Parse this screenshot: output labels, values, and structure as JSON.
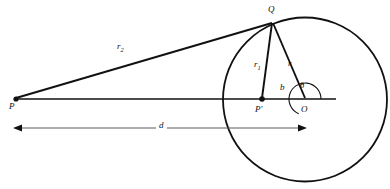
{
  "figure": {
    "type": "geometry-diagram",
    "background_color": "#ffffff",
    "stroke_color": "#111111",
    "dimension_color": "#5a5a5a"
  },
  "points": [
    {
      "id": "P",
      "label": "P",
      "x": 16,
      "y": 99,
      "label_x": 10,
      "label_y": 103,
      "dot": true,
      "dot_r": 2.6
    },
    {
      "id": "Q",
      "label": "Q",
      "x": 272,
      "y": 22,
      "label_x": 269,
      "label_y": 7,
      "dot": false,
      "dot_r": 0
    },
    {
      "id": "Pprime",
      "label": "P′",
      "x": 262,
      "y": 99,
      "label_x": 256,
      "label_y": 106,
      "dot": true,
      "dot_r": 2.8
    },
    {
      "id": "O",
      "label": "O",
      "x": 305,
      "y": 99,
      "label_x": 301,
      "label_y": 106,
      "dot": false,
      "dot_r": 0
    }
  ],
  "circle": {
    "center_x": 305,
    "center_y": 99.5,
    "radius": 82,
    "stroke_width": 1.8
  },
  "baseline": {
    "x1": 16,
    "y1": 99,
    "x2": 336,
    "y2": 99,
    "stroke_width": 1.6
  },
  "segments": [
    {
      "id": "r2",
      "from": "P",
      "to": "Q",
      "x1": 16,
      "y1": 98,
      "x2": 272,
      "y2": 23,
      "stroke_width": 1.9
    },
    {
      "id": "r1",
      "from": "Pprime",
      "to": "Q",
      "x1": 262,
      "y1": 98,
      "x2": 272,
      "y2": 23,
      "stroke_width": 1.9
    },
    {
      "id": "r",
      "from": "O",
      "to": "Q",
      "x1": 305,
      "y1": 98,
      "x2": 273,
      "y2": 23,
      "stroke_width": 1.9
    }
  ],
  "segment_labels": [
    {
      "id": "r2",
      "base": "r",
      "subscript": "2",
      "x": 118,
      "y": 47
    },
    {
      "id": "r1",
      "base": "r",
      "subscript": "1",
      "x": 255,
      "y": 64
    },
    {
      "id": "r",
      "base": "r",
      "subscript": "",
      "x": 289,
      "y": 63
    },
    {
      "id": "b",
      "base": "b",
      "subscript": "",
      "x": 281,
      "y": 87
    }
  ],
  "angle": {
    "id": "theta",
    "label": "θ",
    "label_x": 301,
    "label_y": 85,
    "vertex_x": 305,
    "vertex_y": 99,
    "arc_radius": 16,
    "start_deg": 0,
    "end_deg": 247,
    "stroke_width": 1.1
  },
  "dimension": {
    "id": "d",
    "label": "d",
    "label_x": 157,
    "label_y": 124,
    "y": 128,
    "x_start": 14,
    "x_end": 306,
    "arrow_size": 6,
    "stroke_width": 1.0
  }
}
